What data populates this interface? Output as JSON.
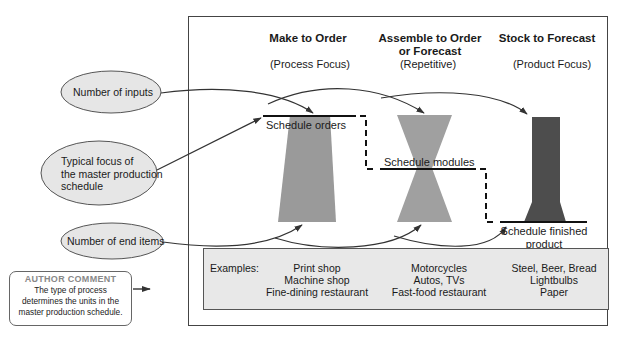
{
  "columns": [
    {
      "title_lines": [
        "Make to Order"
      ],
      "subtitle": "(Process Focus)",
      "schedule_label": "Schedule orders",
      "examples": [
        "Print shop",
        "Machine shop",
        "Fine-dining restaurant"
      ]
    },
    {
      "title_lines": [
        "Assemble to Order",
        "or Forecast"
      ],
      "subtitle": "(Repetitive)",
      "schedule_label": "Schedule modules",
      "examples": [
        "Motorcycles",
        "Autos, TVs",
        "Fast-food restaurant"
      ]
    },
    {
      "title_lines": [
        "Stock to Forecast"
      ],
      "subtitle": "(Product Focus)",
      "schedule_label_lines": [
        "Schedule finished",
        "product"
      ],
      "examples": [
        "Steel, Beer, Bread",
        "Lightbulbs",
        "Paper"
      ]
    }
  ],
  "ovals": {
    "inputs": "Number of inputs",
    "focus_lines": [
      "Typical focus of",
      "the master production",
      "schedule"
    ],
    "end_items": "Number of end items"
  },
  "examples_label": "Examples:",
  "author_comment": {
    "heading": "AUTHOR COMMENT",
    "lines": [
      "The type of process",
      "determines the units in the",
      "master production schedule."
    ]
  },
  "colors": {
    "frame": "#444444",
    "shape_light": "#999999",
    "shape_dark": "#4d4d4d",
    "oval_fill": "#e6e6e6",
    "examples_fill": "#e8e8e8",
    "author_heading": "#888888"
  }
}
